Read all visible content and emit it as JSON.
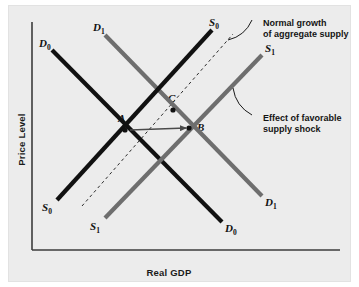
{
  "figure": {
    "background_color": "#ececec",
    "page_color": "#ffffff"
  },
  "axes": {
    "y_label": "Price Level",
    "x_label": "Real GDP",
    "axis_color": "#3d3d3d"
  },
  "colors": {
    "original_curve": "#111111",
    "shifted_curve": "#6e6e6e",
    "dashed_trend": "#2b2b2b",
    "arrow": "#4a4a4a",
    "point": "#111111",
    "text": "#141414"
  },
  "curves": [
    {
      "id": "D0",
      "letter": "D",
      "subscript": "0",
      "kind": "demand",
      "state": "original",
      "color": "#111111",
      "start": [
        52,
        50
      ],
      "end": [
        222,
        222
      ],
      "label_start": {
        "x": 38,
        "y": 37
      },
      "label_end": {
        "x": 224,
        "y": 222
      }
    },
    {
      "id": "D1",
      "letter": "D",
      "subscript": "1",
      "kind": "demand",
      "state": "shifted",
      "color": "#6e6e6e",
      "start": [
        105,
        35
      ],
      "end": [
        262,
        196
      ],
      "label_start": {
        "x": 92,
        "y": 21
      },
      "label_end": {
        "x": 264,
        "y": 196
      }
    },
    {
      "id": "S0",
      "letter": "S",
      "subscript": "0",
      "kind": "supply",
      "state": "original",
      "color": "#111111",
      "start": [
        57,
        200
      ],
      "end": [
        212,
        30
      ],
      "label_start": {
        "x": 41,
        "y": 201
      },
      "label_end": {
        "x": 208,
        "y": 16
      }
    },
    {
      "id": "S1",
      "letter": "S",
      "subscript": "1",
      "kind": "supply",
      "state": "shifted",
      "color": "#6e6e6e",
      "start": [
        105,
        218
      ],
      "end": [
        262,
        55
      ],
      "label_start": {
        "x": 89,
        "y": 220
      },
      "label_end": {
        "x": 264,
        "y": 42
      }
    }
  ],
  "dashed_trend": {
    "label": "normal-growth-path",
    "start": [
      82,
      206
    ],
    "end": [
      233,
      34
    ],
    "dash": "3,3",
    "color": "#2b2b2b"
  },
  "points": [
    {
      "id": "A",
      "label": "A",
      "x": 125,
      "y": 130,
      "label_x": 117,
      "label_y": 112
    },
    {
      "id": "B",
      "label": "B",
      "x": 189,
      "y": 128,
      "label_x": 196,
      "label_y": 121
    },
    {
      "id": "C",
      "label": "C",
      "x": 173,
      "y": 110,
      "label_x": 167,
      "label_y": 92
    }
  ],
  "shift_arrow": {
    "label": "shift-from-a-to-b",
    "start": [
      130,
      130
    ],
    "end": [
      186,
      128
    ]
  },
  "annotations": [
    {
      "id": "normal-growth",
      "lines": [
        "Normal growth",
        "of aggregate supply"
      ],
      "leader": {
        "from": [
          252,
          20
        ],
        "to": [
          228,
          40
        ]
      }
    },
    {
      "id": "supply-shock",
      "lines": [
        "Effect of favorable",
        "supply shock"
      ],
      "leader": {
        "from": [
          252,
          115
        ],
        "to": [
          233,
          88
        ]
      }
    }
  ]
}
